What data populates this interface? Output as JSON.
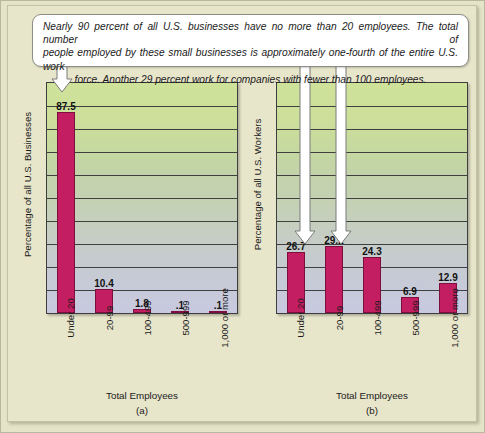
{
  "callout": {
    "line1": "Nearly 90 percent of all U.S. businesses have no more than 20 employees. The total number of",
    "line2": "people employed by these small businesses is approximately one-fourth of the entire U.S. work",
    "line3": "force. Another 29 percent work for companies with fewer than 100 employees."
  },
  "colors": {
    "bar": "#c41e63",
    "bar_border": "#7e0f3c",
    "page_background": "#e7e5ca",
    "plot_top": "#cfe29a",
    "plot_bottom": "#c8c9e0",
    "axis": "#3e3e3e",
    "arrow_fill": "#ffffff",
    "arrow_stroke": "#6d6d6d"
  },
  "chart_data": [
    {
      "type": "bar",
      "id": "a",
      "title": "",
      "subcaption": "(a)",
      "xlabel": "Total Employees",
      "ylabel": "Percentage of all U.S. Businesses",
      "categories": [
        "Under 20",
        "20-99",
        "100-499",
        "500-999",
        "1,000 or more"
      ],
      "values": [
        87.5,
        10.4,
        1.8,
        0.1,
        0.1
      ],
      "value_labels": [
        "87.5",
        "10.4",
        "1.8",
        ".1",
        ".1"
      ],
      "ylim": [
        0,
        100
      ],
      "gridlines": 9,
      "grid": true,
      "legend": "none",
      "annotations": [
        {
          "label": "arrow-to-under-20",
          "target_category": "Under 20",
          "target_value": 87.5
        }
      ]
    },
    {
      "type": "bar",
      "id": "b",
      "title": "",
      "subcaption": "(b)",
      "xlabel": "Total Employees",
      "ylabel": "Percentage of all U.S. Workers",
      "categories": [
        "Under 20",
        "20-99",
        "100-499",
        "500-999",
        "1,000 or more"
      ],
      "values": [
        26.7,
        29.2,
        24.3,
        6.9,
        12.9
      ],
      "value_labels": [
        "26.7",
        "29.2",
        "24.3",
        "6.9",
        "12.9"
      ],
      "ylim": [
        0,
        100
      ],
      "gridlines": 9,
      "grid": true,
      "legend": "none",
      "annotations": [
        {
          "label": "arrow-to-under-20",
          "target_category": "Under 20",
          "target_value": 26.7
        },
        {
          "label": "arrow-to-20-99",
          "target_category": "20-99",
          "target_value": 29.2
        }
      ]
    }
  ]
}
